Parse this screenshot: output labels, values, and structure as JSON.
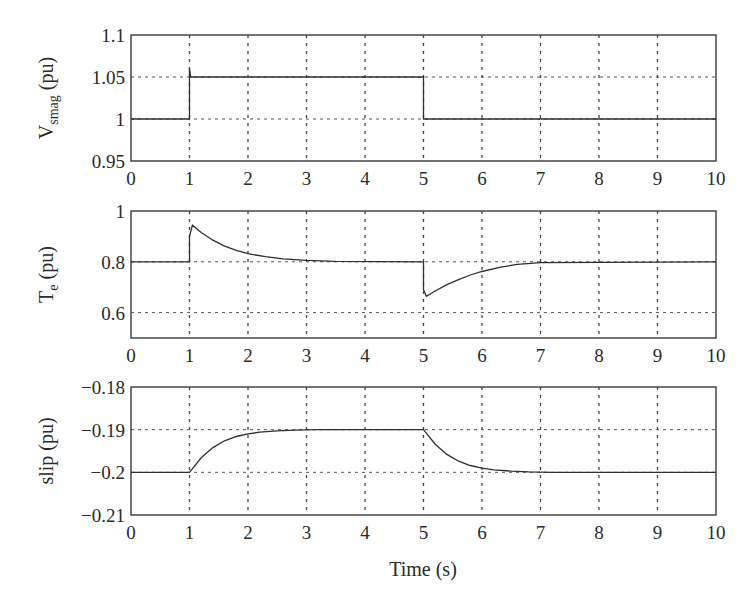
{
  "figure": {
    "xlabel": "Time (s)",
    "x_ticks": [
      "0",
      "1",
      "2",
      "3",
      "4",
      "5",
      "6",
      "7",
      "8",
      "9",
      "10"
    ]
  },
  "chart_data": [
    {
      "type": "line",
      "title": "",
      "ylabel": "V",
      "ylabel_sub": "smag",
      "ylabel_unit": " (pu)",
      "xlabel": "",
      "xlim": [
        0,
        10
      ],
      "ylim": [
        0.95,
        1.1
      ],
      "y_ticks": [
        0.95,
        1,
        1.05,
        1.1
      ],
      "y_tick_labels": [
        "0.95",
        "1",
        "1.05",
        "1.1"
      ],
      "grid": true,
      "series": [
        {
          "name": "Vsmag",
          "x": [
            0,
            1,
            1,
            1.02,
            5,
            5,
            10
          ],
          "y": [
            1.0,
            1.0,
            1.06,
            1.05,
            1.05,
            1.0,
            1.0
          ]
        }
      ]
    },
    {
      "type": "line",
      "title": "",
      "ylabel": "T",
      "ylabel_sub": "e",
      "ylabel_unit": " (pu)",
      "xlabel": "",
      "xlim": [
        0,
        10
      ],
      "ylim": [
        0.5,
        1.0
      ],
      "y_ticks": [
        0.6,
        0.8,
        1
      ],
      "y_tick_labels": [
        "0.6",
        "0.8",
        "1"
      ],
      "grid": true,
      "series": [
        {
          "name": "Te",
          "x": [
            0,
            1,
            1,
            1.05,
            1.2,
            1.4,
            1.6,
            1.8,
            2.0,
            2.3,
            2.6,
            3.0,
            3.5,
            5,
            5,
            5.05,
            5.2,
            5.4,
            5.6,
            5.8,
            6.0,
            6.3,
            6.6,
            7.0,
            10
          ],
          "y": [
            0.8,
            0.8,
            0.9,
            0.944,
            0.915,
            0.885,
            0.862,
            0.845,
            0.832,
            0.82,
            0.812,
            0.806,
            0.802,
            0.8,
            0.69,
            0.664,
            0.685,
            0.71,
            0.73,
            0.748,
            0.762,
            0.778,
            0.79,
            0.797,
            0.8
          ]
        }
      ]
    },
    {
      "type": "line",
      "title": "",
      "ylabel": "slip",
      "ylabel_sub": "",
      "ylabel_unit": " (pu)",
      "xlabel": "Time (s)",
      "xlim": [
        0,
        10
      ],
      "ylim": [
        -0.21,
        -0.18
      ],
      "y_ticks": [
        -0.21,
        -0.2,
        -0.19,
        -0.18
      ],
      "y_tick_labels": [
        "−0.21",
        "−0.2",
        "−0.19",
        "−0.18"
      ],
      "grid": true,
      "series": [
        {
          "name": "slip",
          "x": [
            0,
            1,
            1.2,
            1.4,
            1.6,
            1.8,
            2.0,
            2.2,
            2.5,
            2.8,
            3.2,
            5,
            5.2,
            5.4,
            5.6,
            5.8,
            6.0,
            6.2,
            6.5,
            6.8,
            7.2,
            10
          ],
          "y": [
            -0.2,
            -0.2,
            -0.1966,
            -0.1942,
            -0.1926,
            -0.1916,
            -0.191,
            -0.1906,
            -0.1903,
            -0.1901,
            -0.19,
            -0.19,
            -0.1934,
            -0.1958,
            -0.1974,
            -0.1984,
            -0.199,
            -0.1994,
            -0.1997,
            -0.1999,
            -0.2,
            -0.2
          ]
        }
      ]
    }
  ]
}
